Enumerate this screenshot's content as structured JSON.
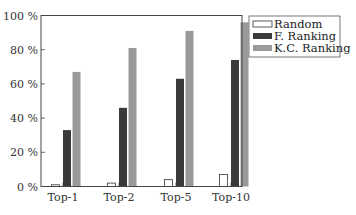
{
  "chart_data": {
    "type": "bar",
    "title": "",
    "xlabel": "",
    "ylabel": "",
    "categories": [
      "Top-1",
      "Top-2",
      "Top-5",
      "Top-10"
    ],
    "series": [
      {
        "name": "Random",
        "values": [
          1,
          2,
          4,
          7
        ],
        "color": "#ffffff",
        "stroke": "#333333"
      },
      {
        "name": "F. Ranking",
        "values": [
          33,
          46,
          63,
          74
        ],
        "color": "#3a3a3a"
      },
      {
        "name": "K.C. Ranking",
        "values": [
          67,
          81,
          91,
          96
        ],
        "color": "#9a9a9a"
      }
    ],
    "ylim": [
      0,
      100
    ],
    "yticks": [
      "0 %",
      "20 %",
      "40 %",
      "60 %",
      "80 %",
      "100 %"
    ],
    "grid": false,
    "legend_position": "upper right, outside plot"
  }
}
